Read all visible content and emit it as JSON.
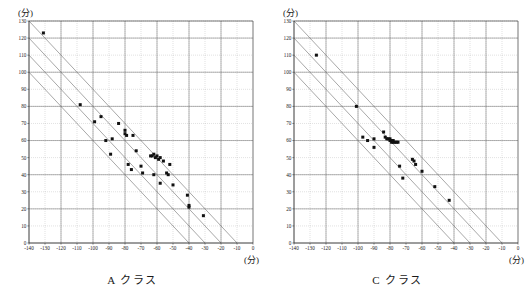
{
  "figure": {
    "unit_label_y": "(分)",
    "unit_label_x": "(分)"
  },
  "panels": [
    {
      "id": "panel-a",
      "caption": "A クラス",
      "unit_y": "(分)",
      "unit_x": "(分)"
    },
    {
      "id": "panel-c",
      "caption": "C クラス",
      "unit_y": "(分)",
      "unit_x": "(分)"
    }
  ],
  "chart_data": [
    {
      "type": "scatter",
      "title": "A クラス",
      "xlabel": "(分)",
      "ylabel": "(分)",
      "xlim": [
        -140,
        0
      ],
      "ylim": [
        0,
        130
      ],
      "xticks": [
        -140,
        -130,
        -120,
        -110,
        -100,
        -90,
        -80,
        -70,
        -60,
        -50,
        -40,
        -30,
        -20,
        -10,
        0
      ],
      "yticks": [
        0,
        10,
        20,
        30,
        40,
        50,
        60,
        70,
        80,
        90,
        100,
        110,
        120,
        130
      ],
      "xticklabels": [
        "-140",
        "-130",
        "-120",
        "-110",
        "-100",
        "-90",
        "-80",
        "-70",
        "-60",
        "-50",
        "-40",
        "-30",
        "-20",
        "-10",
        "0"
      ],
      "yticklabels": [
        "0",
        "10",
        "20",
        "30",
        "40",
        "50",
        "60",
        "70",
        "80",
        "90",
        "100",
        "110",
        "120",
        "130"
      ],
      "grid": true,
      "legend": null,
      "reference_lines": {
        "type": "diagonal",
        "slope": -1,
        "description": "lines of constant x+y; intercepts on x-axis",
        "x_intercepts": [
          0,
          -10,
          -20,
          -30,
          -40
        ]
      },
      "points": [
        [
          -131,
          123
        ],
        [
          -108,
          81
        ],
        [
          -99,
          71
        ],
        [
          -95,
          74
        ],
        [
          -92,
          60
        ],
        [
          -88,
          61
        ],
        [
          -89,
          52
        ],
        [
          -84,
          70
        ],
        [
          -80,
          64
        ],
        [
          -79,
          63
        ],
        [
          -80,
          66
        ],
        [
          -78,
          46
        ],
        [
          -75,
          63
        ],
        [
          -73,
          54
        ],
        [
          -76,
          43
        ],
        [
          -70,
          45
        ],
        [
          -69,
          41
        ],
        [
          -64,
          51
        ],
        [
          -63,
          51
        ],
        [
          -62,
          52
        ],
        [
          -62,
          40
        ],
        [
          -61,
          50
        ],
        [
          -60,
          51
        ],
        [
          -59,
          49
        ],
        [
          -58,
          50
        ],
        [
          -58,
          35
        ],
        [
          -56,
          48
        ],
        [
          -54,
          41
        ],
        [
          -53,
          40
        ],
        [
          -52,
          46
        ],
        [
          -50,
          34
        ],
        [
          -41,
          28
        ],
        [
          -40,
          22
        ],
        [
          -40,
          21
        ],
        [
          -31,
          16
        ]
      ]
    },
    {
      "type": "scatter",
      "title": "C クラス",
      "xlabel": "(分)",
      "ylabel": "(分)",
      "xlim": [
        -140,
        0
      ],
      "ylim": [
        0,
        130
      ],
      "xticks": [
        -140,
        -130,
        -120,
        -110,
        -100,
        -90,
        -80,
        -70,
        -60,
        -50,
        -40,
        -30,
        -20,
        -10,
        0
      ],
      "yticks": [
        0,
        10,
        20,
        30,
        40,
        50,
        60,
        70,
        80,
        90,
        100,
        110,
        120,
        130
      ],
      "xticklabels": [
        "-140",
        "-130",
        "-120",
        "-110",
        "-100",
        "-90",
        "-80",
        "-70",
        "-60",
        "-50",
        "-40",
        "-30",
        "-20",
        "-10",
        "0"
      ],
      "yticklabels": [
        "0",
        "10",
        "20",
        "30",
        "40",
        "50",
        "60",
        "70",
        "80",
        "90",
        "100",
        "110",
        "120",
        "130"
      ],
      "grid": true,
      "legend": null,
      "reference_lines": {
        "type": "diagonal",
        "slope": -1,
        "description": "lines of constant x+y; intercepts on x-axis",
        "x_intercepts": [
          0,
          -10,
          -20,
          -30,
          -40
        ]
      },
      "points": [
        [
          -126,
          110
        ],
        [
          -101,
          80
        ],
        [
          -97,
          62
        ],
        [
          -94,
          60
        ],
        [
          -90,
          61
        ],
        [
          -90,
          56
        ],
        [
          -84,
          65
        ],
        [
          -83,
          62
        ],
        [
          -82,
          61
        ],
        [
          -81,
          61
        ],
        [
          -80,
          60
        ],
        [
          -80,
          61
        ],
        [
          -79,
          60
        ],
        [
          -79,
          59
        ],
        [
          -78,
          60
        ],
        [
          -78,
          59
        ],
        [
          -77,
          59
        ],
        [
          -76,
          59
        ],
        [
          -75,
          59
        ],
        [
          -74,
          45
        ],
        [
          -72,
          38
        ],
        [
          -66,
          49
        ],
        [
          -65,
          48
        ],
        [
          -64,
          46
        ],
        [
          -60,
          42
        ],
        [
          -52,
          33
        ],
        [
          -43,
          25
        ]
      ]
    }
  ]
}
